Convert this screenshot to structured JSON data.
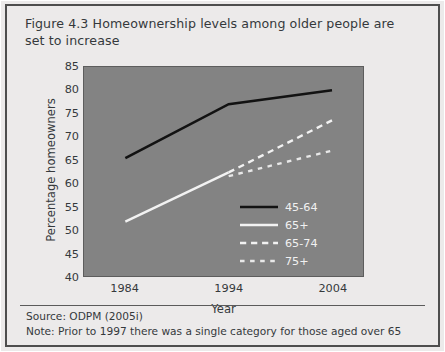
{
  "figure": {
    "title": "Figure 4.3 Homeownership levels among older people are set to increase"
  },
  "footer": {
    "source": "Source: ODPM (2005i)",
    "note": "Note: Prior to 1997 there was a single category for those aged over 65"
  },
  "colors": {
    "plot_background": "#838383",
    "panel_background": "#eceaea",
    "frame": "#4e4e4e",
    "series_45_64": "#121212",
    "series_65_plus": "#f2f2f2",
    "series_65_74": "#f2f2f2",
    "series_75_plus": "#e8e8e8",
    "text": "#35393c",
    "legend_text": "#f1f1f1"
  },
  "chart_data": {
    "type": "line",
    "title": "Figure 4.3 Homeownership levels among older people are set to increase",
    "xlabel": "Year",
    "ylabel": "Percentage homeowners",
    "x": [
      1984,
      1994,
      2004
    ],
    "categories": [
      "1984",
      "1994",
      "2004"
    ],
    "xtick_labels": [
      "1984",
      "1994",
      "2004"
    ],
    "ytick_labels": [
      "85",
      "80",
      "75",
      "70",
      "65",
      "60",
      "55",
      "50",
      "45",
      "40"
    ],
    "yticks": [
      85,
      80,
      75,
      70,
      65,
      60,
      55,
      50,
      45,
      40
    ],
    "ylim": [
      40,
      85
    ],
    "xlim": [
      1980,
      2007
    ],
    "grid": false,
    "legend_position": "bottom-right inside plot",
    "series": [
      {
        "name": "45-64",
        "label": "45-64",
        "color": "#121212",
        "style": "solid",
        "x": [
          1984,
          1994,
          2004
        ],
        "values": [
          65.4,
          77.0,
          80.0
        ]
      },
      {
        "name": "65+",
        "label": "65+",
        "color": "#f2f2f2",
        "style": "solid",
        "x": [
          1984,
          1994
        ],
        "values": [
          51.7,
          62.3
        ]
      },
      {
        "name": "65-74",
        "label": "65-74",
        "color": "#f2f2f2",
        "style": "dashed",
        "x": [
          1994,
          2004
        ],
        "values": [
          62.3,
          73.5
        ]
      },
      {
        "name": "75+",
        "label": "75+",
        "color": "#e8e8e8",
        "style": "dotted",
        "x": [
          1994,
          2004
        ],
        "values": [
          61.5,
          67.0
        ]
      }
    ]
  }
}
